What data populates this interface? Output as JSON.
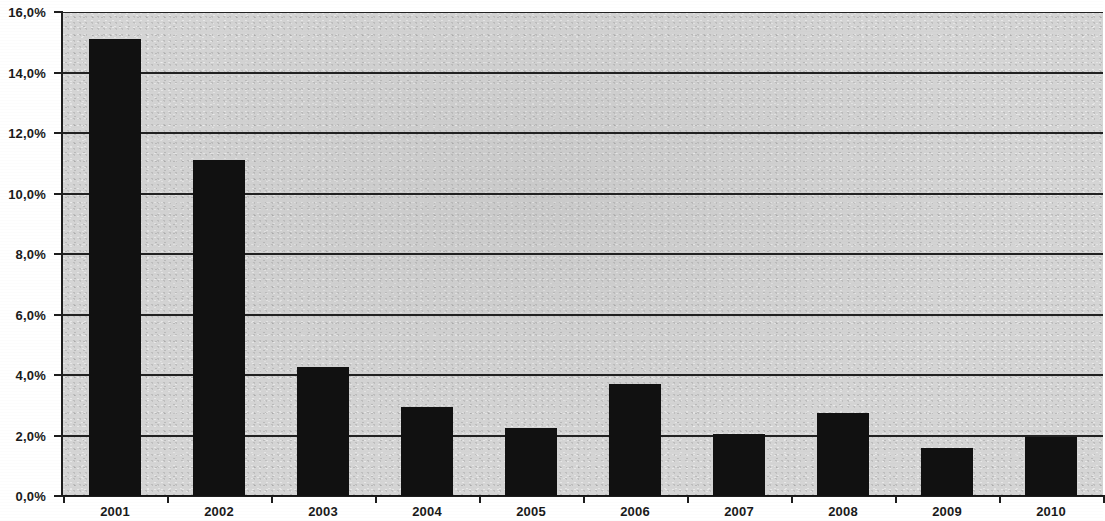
{
  "chart_data": {
    "type": "bar",
    "title": "",
    "subtitle": "",
    "xlabel": "",
    "ylabel": "",
    "categories": [
      "2001",
      "2002",
      "2003",
      "2004",
      "2005",
      "2006",
      "2007",
      "2008",
      "2009",
      "2010"
    ],
    "values": [
      15.1,
      11.1,
      4.25,
      2.95,
      2.25,
      3.7,
      2.05,
      2.75,
      1.6,
      1.95
    ],
    "value_suffix": "%",
    "decimal_separator": ",",
    "ylim": [
      0,
      16
    ],
    "ytick_step": 2,
    "ytick_labels": [
      "0,0%",
      "2,0%",
      "4,0%",
      "6,0%",
      "8,0%",
      "10,0%",
      "12,0%",
      "14,0%",
      "16,0%"
    ],
    "ytick_values": [
      0,
      2,
      4,
      6,
      8,
      10,
      12,
      14,
      16
    ],
    "grid": true,
    "grid_axis": "y",
    "legend": false,
    "legend_position": "none",
    "series": [
      {
        "name": "",
        "values": [
          15.1,
          11.1,
          4.25,
          2.95,
          2.25,
          3.7,
          2.05,
          2.75,
          1.6,
          1.95
        ]
      }
    ],
    "colors": {
      "bar": "#111111",
      "plot_background": "#d5d5d5",
      "gridline": "#212121",
      "axis": "#1d1d1d",
      "text": "#1a1a1a",
      "page_background": "#ffffff"
    }
  }
}
